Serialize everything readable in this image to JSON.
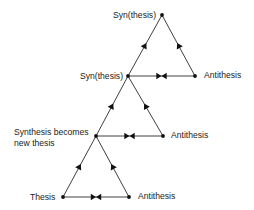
{
  "diagram": {
    "colors": {
      "line": "#2a2a2a",
      "node": "#111111",
      "arrow": "#111111",
      "text": "#1a1a1a"
    },
    "nodes": [
      {
        "id": "thesis",
        "label": "Thesis",
        "x": 63,
        "y": 197
      },
      {
        "id": "antithesis1",
        "label": "Antithesis",
        "x": 129,
        "y": 197
      },
      {
        "id": "synthesis1",
        "label": "Synthesis becomes",
        "label2": "new thesis",
        "x": 96,
        "y": 136
      },
      {
        "id": "antithesis2",
        "label": "Antithesis",
        "x": 163,
        "y": 136
      },
      {
        "id": "synthesis2",
        "label": "Syn(thesis)",
        "x": 128,
        "y": 76
      },
      {
        "id": "antithesis3",
        "label": "Antithesis",
        "x": 195,
        "y": 76
      },
      {
        "id": "synthesis3",
        "label": "Syn(thesis)",
        "x": 162,
        "y": 15
      }
    ],
    "edges": [
      {
        "from": "thesis",
        "to": "synthesis1",
        "type": "directed"
      },
      {
        "from": "antithesis1",
        "to": "synthesis1",
        "type": "directed"
      },
      {
        "from": "thesis",
        "to": "antithesis1",
        "type": "opposition"
      },
      {
        "from": "synthesis1",
        "to": "synthesis2",
        "type": "directed"
      },
      {
        "from": "antithesis2",
        "to": "synthesis2",
        "type": "directed"
      },
      {
        "from": "synthesis1",
        "to": "antithesis2",
        "type": "opposition"
      },
      {
        "from": "synthesis2",
        "to": "synthesis3",
        "type": "directed"
      },
      {
        "from": "antithesis3",
        "to": "synthesis3",
        "type": "directed"
      },
      {
        "from": "synthesis2",
        "to": "antithesis3",
        "type": "opposition"
      }
    ]
  },
  "labels": {
    "top_synthesis": "Syn(thesis)",
    "mid_synthesis": "Syn(thesis)",
    "top_antithesis": "Antithesis",
    "new_thesis_line1": "Synthesis becomes",
    "new_thesis_line2": "new thesis",
    "mid_antithesis": "Antithesis",
    "thesis": "Thesis",
    "bottom_antithesis": "Antithesis"
  }
}
